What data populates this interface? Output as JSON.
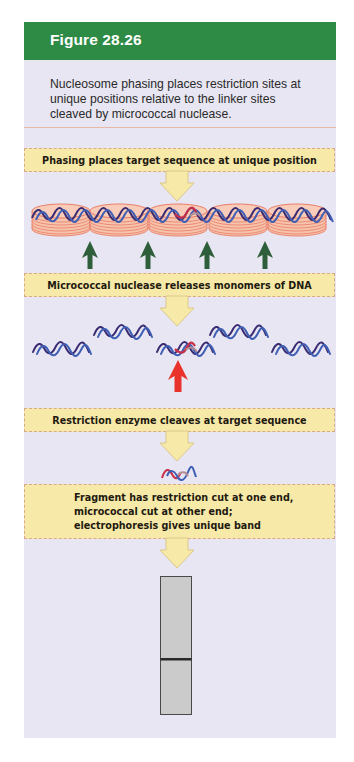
{
  "figure": {
    "title": "Figure 28.26",
    "caption": "Nucleosome phasing places restriction sites at unique positions relative to the linker sites cleaved by micrococcal nuclease."
  },
  "steps": [
    {
      "label": "Phasing places target sequence at unique position"
    },
    {
      "label": "Micrococcal nuclease releases monomers of DNA"
    },
    {
      "label": "Restriction enzyme cleaves at target sequence"
    },
    {
      "lines": [
        "Fragment has restriction cut at one end,",
        "micrococcal cut at other end;",
        "electrophoresis gives unique band"
      ]
    }
  ],
  "diagram": {
    "nucleosome_count": 5,
    "cleavage_arrow_count": 4,
    "monomer_count": 5,
    "target_monomer_index": 2,
    "gel_band_count": 1
  },
  "colors": {
    "header_green": "#2e8b45",
    "panel_bg": "#e8e6f2",
    "banner_fill": "#f7e9a8",
    "nucleosome_fill": "#f6c3ad",
    "nucleosome_stroke": "#e8735a",
    "dna_blue": "#3f5fb5",
    "dna_purple": "#3b2c72",
    "target_red": "#c8304a",
    "micrococcal_arrow": "#2f5e3a",
    "restriction_arrow": "#e8322a",
    "gel_fill": "#cbcbcb"
  }
}
